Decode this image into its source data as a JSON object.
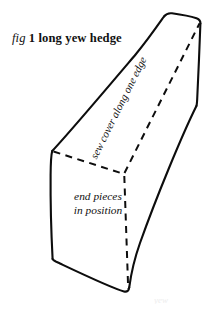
{
  "figure": {
    "caption": {
      "fig_word": "fig",
      "rest": "1 long yew hedge"
    },
    "labels": {
      "end_pieces_line1": "end pieces",
      "end_pieces_line2": "in position",
      "sew_cover": "sew cover along one edge"
    },
    "faint_artifact": "yew",
    "colors": {
      "ink": "#0d0d0d",
      "paper": "#ffffff",
      "face_fill": "#ffffff",
      "artifact": "#ededed"
    },
    "geometry": {
      "description": "Hand-drawn 3D rectangular box (elongated prism) shown in oblique view, long axis running from lower-left front to upper-right back, with hidden edges dashed.",
      "visible_faces": [
        "left-end-cap",
        "top-long-face",
        "right-long-face"
      ],
      "hidden_vertex": "rear-bottom-left corner of the near end cap"
    }
  }
}
